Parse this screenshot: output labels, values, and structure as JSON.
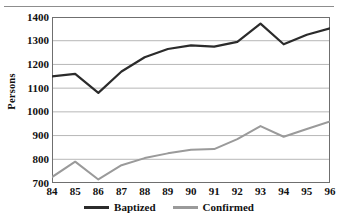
{
  "figure": {
    "name": "line-chart-baptized-confirmed",
    "has_top_rule": true
  },
  "chart_data": {
    "type": "line",
    "title": "",
    "subtitle": "",
    "xlabel": "",
    "ylabel": "Persons",
    "categories": [
      "84",
      "85",
      "86",
      "87",
      "88",
      "89",
      "90",
      "91",
      "92",
      "93",
      "94",
      "95",
      "96"
    ],
    "x": [
      84,
      85,
      86,
      87,
      88,
      89,
      90,
      91,
      92,
      93,
      94,
      95,
      96
    ],
    "series": [
      {
        "name": "Baptized",
        "color": "#2b2b2b",
        "values": [
          1150,
          1160,
          1080,
          1170,
          1230,
          1265,
          1280,
          1275,
          1295,
          1372,
          1285,
          1325,
          1352
        ]
      },
      {
        "name": "Confirmed",
        "color": "#9a9a9a",
        "values": [
          725,
          790,
          715,
          775,
          805,
          825,
          840,
          843,
          885,
          940,
          895,
          928,
          960
        ]
      }
    ],
    "ylim": [
      700,
      1400
    ],
    "yticks": [
      1400,
      1300,
      1200,
      1100,
      1000,
      900,
      800,
      700
    ],
    "ytick_labels": [
      "1400",
      "1300",
      "1200",
      "1100",
      "1000",
      "900",
      "800",
      "700"
    ],
    "xlim": [
      84,
      96
    ],
    "grid": "horizontal",
    "grid_color": "#b7b7b7",
    "axis_color": "#6f6f6f",
    "legend_position": "bottom-center",
    "legend": [
      "Baptized",
      "Confirmed"
    ]
  }
}
